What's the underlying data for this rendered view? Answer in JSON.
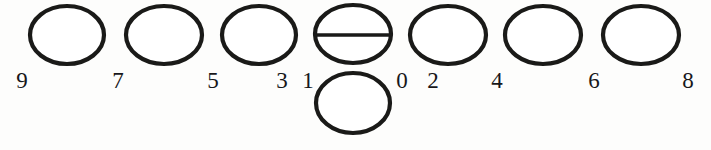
{
  "figure": {
    "background_color": "#fdfdfc",
    "ink_color": "#1a1a18",
    "label_color": "#17171a",
    "canvas": {
      "width": 711,
      "height": 150
    }
  },
  "shapes": [
    {
      "name": "ellipse-1",
      "cx": 67,
      "cy": 35,
      "rx": 37,
      "ry": 29,
      "stroke_width": 4.2,
      "divider": false,
      "row": "top"
    },
    {
      "name": "ellipse-2",
      "cx": 164,
      "cy": 35,
      "rx": 38,
      "ry": 29,
      "stroke_width": 4.2,
      "divider": false,
      "row": "top"
    },
    {
      "name": "ellipse-3",
      "cx": 259,
      "cy": 35,
      "rx": 37,
      "ry": 29,
      "stroke_width": 4.2,
      "divider": false,
      "row": "top"
    },
    {
      "name": "ellipse-4-divided",
      "cx": 353,
      "cy": 34,
      "rx": 38,
      "ry": 29,
      "stroke_width": 4.2,
      "divider": true,
      "divider_y": 35,
      "row": "top"
    },
    {
      "name": "ellipse-5",
      "cx": 448,
      "cy": 35,
      "rx": 38,
      "ry": 29,
      "stroke_width": 4.2,
      "divider": false,
      "row": "top"
    },
    {
      "name": "ellipse-6",
      "cx": 543,
      "cy": 35,
      "rx": 38,
      "ry": 29,
      "stroke_width": 4.2,
      "divider": false,
      "row": "top"
    },
    {
      "name": "ellipse-7",
      "cx": 641,
      "cy": 35,
      "rx": 38,
      "ry": 29,
      "stroke_width": 4.2,
      "divider": false,
      "row": "top"
    },
    {
      "name": "ellipse-8-lower",
      "cx": 353,
      "cy": 103,
      "rx": 37,
      "ry": 30,
      "stroke_width": 4.2,
      "divider": false,
      "row": "bottom"
    }
  ],
  "labels": [
    {
      "name": "label-9",
      "text": "9",
      "x": 22,
      "baseline_y": 92
    },
    {
      "name": "label-7",
      "text": "7",
      "x": 118,
      "baseline_y": 92
    },
    {
      "name": "label-5",
      "text": "5",
      "x": 213,
      "baseline_y": 92
    },
    {
      "name": "label-3",
      "text": "3",
      "x": 282,
      "baseline_y": 92
    },
    {
      "name": "label-1",
      "text": "1",
      "x": 308,
      "baseline_y": 92
    },
    {
      "name": "label-0",
      "text": "0",
      "x": 402,
      "baseline_y": 92
    },
    {
      "name": "label-2",
      "text": "2",
      "x": 433,
      "baseline_y": 92
    },
    {
      "name": "label-4",
      "text": "4",
      "x": 497,
      "baseline_y": 92
    },
    {
      "name": "label-6",
      "text": "6",
      "x": 594,
      "baseline_y": 92
    },
    {
      "name": "label-8",
      "text": "8",
      "x": 688,
      "baseline_y": 92
    }
  ]
}
